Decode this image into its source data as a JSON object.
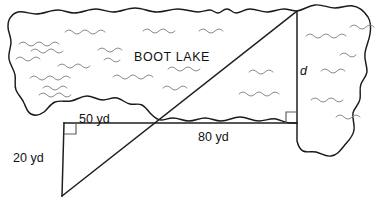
{
  "figure": {
    "lake_label": "BOOT LAKE",
    "labels": {
      "top_leg": "50 yd",
      "bottom_leg": "80 yd",
      "left_leg": "20 yd",
      "unknown": "d"
    },
    "colors": {
      "outline": "#1a1a1a",
      "wave": "#8a8a8a",
      "measure": "#1f1f1f",
      "angle_mark": "#5a5a5a",
      "background": "#ffffff",
      "text": "#111111"
    },
    "geometry": {
      "small_triangle": {
        "vertices": [
          [
            64,
            123
          ],
          [
            172,
            123
          ],
          [
            62,
            196
          ]
        ],
        "right_angle_at": [
          64,
          123
        ],
        "horizontal_leg_label": "50 yd",
        "vertical_leg_label": "20 yd"
      },
      "large_triangle": {
        "vertices": [
          [
            62,
            196
          ],
          [
            297,
            123
          ],
          [
            297,
            11
          ]
        ],
        "right_angle_at": [
          297,
          123
        ],
        "horizontal_leg_label": "80 yd",
        "vertical_leg_label": "d"
      },
      "transversal": {
        "from": [
          62,
          196
        ],
        "to": [
          297,
          11
        ]
      }
    },
    "measurements": [
      {
        "name": "top_leg",
        "value": 50,
        "unit": "yd"
      },
      {
        "name": "bottom_leg",
        "value": 80,
        "unit": "yd"
      },
      {
        "name": "left_leg",
        "value": 20,
        "unit": "yd"
      },
      {
        "name": "unknown_height",
        "value": null,
        "unit": "yd",
        "symbol": "d"
      }
    ],
    "wave_count": 23
  }
}
